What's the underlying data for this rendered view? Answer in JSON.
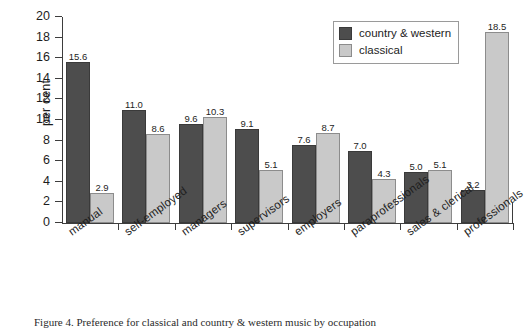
{
  "chart_data": {
    "type": "bar",
    "title": "",
    "subtitle": "",
    "xlabel": "",
    "ylabel": "per cent",
    "ylim": [
      0,
      20
    ],
    "yticks": [
      0,
      2,
      4,
      6,
      8,
      10,
      12,
      14,
      16,
      18,
      20
    ],
    "grid": false,
    "legend_position": "top-right",
    "categories": [
      "manual",
      "self-employed",
      "managers",
      "supervisors",
      "employers",
      "paraprofessionals",
      "sales & clerical",
      "professionals"
    ],
    "series": [
      {
        "name": "country & western",
        "color": "#4d4d4d",
        "values": [
          15.6,
          11.0,
          9.6,
          9.1,
          7.6,
          7.0,
          5.0,
          3.2
        ]
      },
      {
        "name": "classical",
        "color": "#c9c9c9",
        "values": [
          2.9,
          8.6,
          10.3,
          5.1,
          8.7,
          4.3,
          5.1,
          18.5
        ]
      }
    ],
    "data_labels": [
      [
        "15.6",
        "2.9"
      ],
      [
        "11.0",
        "8.6"
      ],
      [
        "9.6",
        "10.3"
      ],
      [
        "9.1",
        "5.1"
      ],
      [
        "7.6",
        "8.7"
      ],
      [
        "7.0",
        "4.3"
      ],
      [
        "5.0",
        "5.1"
      ],
      [
        "3.2",
        "18.5"
      ]
    ]
  },
  "legend": {
    "items": [
      {
        "label": "country & western",
        "swatch": "dark"
      },
      {
        "label": "classical",
        "swatch": "light"
      }
    ]
  },
  "caption": {
    "text": "Figure 4. Preference for classical and country & western music by occupation"
  }
}
